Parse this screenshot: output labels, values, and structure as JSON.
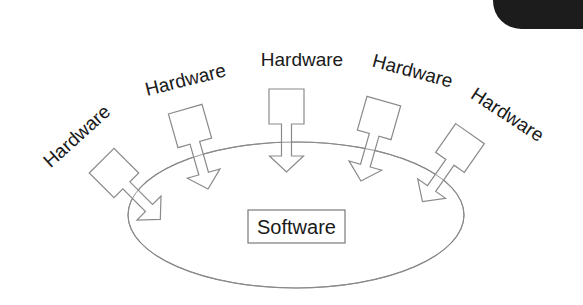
{
  "diagram": {
    "center_node": {
      "label": "Software"
    },
    "peripheral_nodes": [
      {
        "label": "Hardware"
      },
      {
        "label": "Hardware"
      },
      {
        "label": "Hardware"
      },
      {
        "label": "Hardware"
      },
      {
        "label": "Hardware"
      }
    ],
    "edges": [
      {
        "from": "Hardware 1",
        "to": "Software",
        "shape": "block-arrow"
      },
      {
        "from": "Hardware 2",
        "to": "Software",
        "shape": "block-arrow"
      },
      {
        "from": "Hardware 3",
        "to": "Software",
        "shape": "block-arrow"
      },
      {
        "from": "Hardware 4",
        "to": "Software",
        "shape": "block-arrow"
      },
      {
        "from": "Hardware 5",
        "to": "Software",
        "shape": "block-arrow"
      }
    ],
    "colors": {
      "stroke": "#808080",
      "text": "#1a1a1a",
      "background": "#ffffff",
      "corner_shape": "#1c1c1c"
    }
  }
}
